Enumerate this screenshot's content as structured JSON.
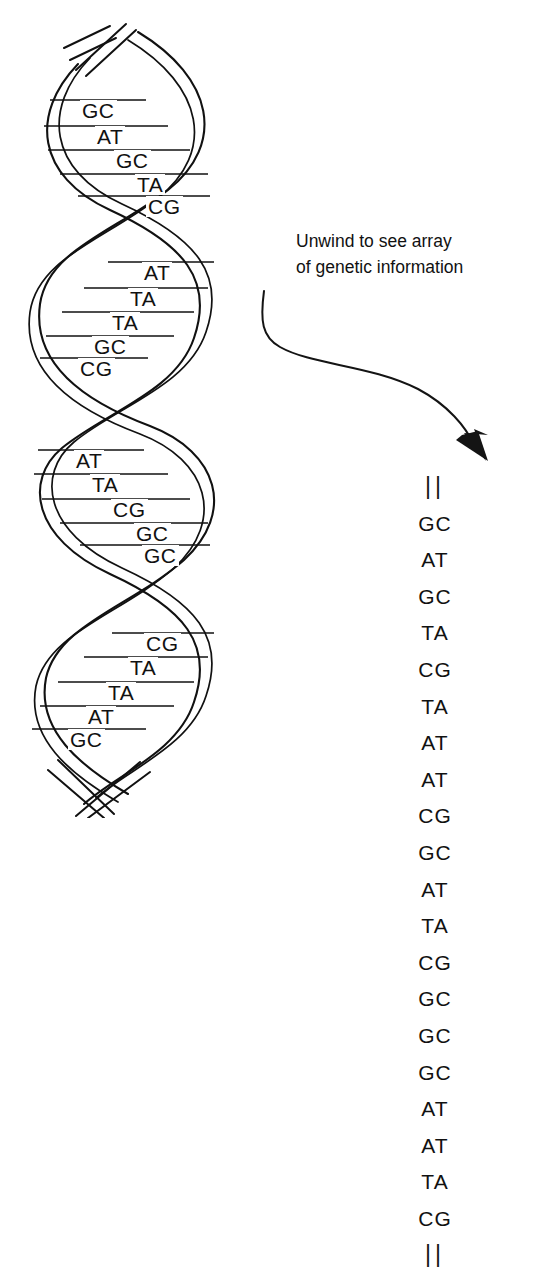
{
  "figure": {
    "title_alt": "DNA double helix unwinding to a linear base-pair sequence",
    "background_color": "#ffffff",
    "ink_color": "#111111"
  },
  "annotation": {
    "line1": "Unwind to see array",
    "line2": "of genetic information"
  },
  "helix": {
    "turns": [
      {
        "index": 1,
        "base_pairs": [
          {
            "label": "GC",
            "x": 62,
            "y": 100
          },
          {
            "label": "AT",
            "x": 77,
            "y": 126
          },
          {
            "label": "GC",
            "x": 96,
            "y": 150
          },
          {
            "label": "TA",
            "x": 117,
            "y": 174
          },
          {
            "label": "CG",
            "x": 128,
            "y": 196
          }
        ]
      },
      {
        "index": 2,
        "base_pairs": [
          {
            "label": "AT",
            "x": 124,
            "y": 262
          },
          {
            "label": "TA",
            "x": 110,
            "y": 288
          },
          {
            "label": "TA",
            "x": 92,
            "y": 312
          },
          {
            "label": "GC",
            "x": 74,
            "y": 336
          },
          {
            "label": "CG",
            "x": 60,
            "y": 358
          }
        ]
      },
      {
        "index": 3,
        "base_pairs": [
          {
            "label": "AT",
            "x": 56,
            "y": 450
          },
          {
            "label": "TA",
            "x": 72,
            "y": 474
          },
          {
            "label": "CG",
            "x": 93,
            "y": 499
          },
          {
            "label": "GC",
            "x": 116,
            "y": 523
          },
          {
            "label": "GC",
            "x": 124,
            "y": 545
          }
        ]
      },
      {
        "index": 4,
        "base_pairs": [
          {
            "label": "CG",
            "x": 126,
            "y": 633
          },
          {
            "label": "TA",
            "x": 110,
            "y": 657
          },
          {
            "label": "TA",
            "x": 88,
            "y": 682
          },
          {
            "label": "AT",
            "x": 68,
            "y": 706
          },
          {
            "label": "GC",
            "x": 50,
            "y": 729
          }
        ]
      }
    ]
  },
  "sequence": {
    "items": [
      "||",
      "GC",
      "AT",
      "GC",
      "TA",
      "CG",
      "TA",
      "AT",
      "AT",
      "CG",
      "GC",
      "AT",
      "TA",
      "CG",
      "GC",
      "GC",
      "GC",
      "AT",
      "AT",
      "TA",
      "CG",
      "||"
    ]
  }
}
